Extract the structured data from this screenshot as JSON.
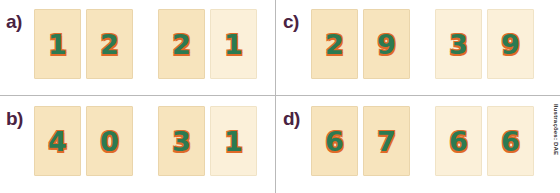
{
  "page": {
    "credit": "Ilustrações: DAE",
    "colors": {
      "card_fill": "#f7e4bd",
      "card_fill_pale": "#fbf0d9",
      "card_border": "#ead5ab",
      "digit_green": "#2c7a52",
      "digit_shadow_orange": "#e06a28",
      "label_purple": "#4a2342",
      "divider_gray": "#b9b9b9",
      "background": "#ffffff"
    }
  },
  "items": [
    {
      "id": "a",
      "label": "a)",
      "left_group": {
        "cards": [
          {
            "digit": "1",
            "pale": false
          },
          {
            "digit": "2",
            "pale": false
          }
        ]
      },
      "right_group": {
        "cards": [
          {
            "digit": "2",
            "pale": false
          },
          {
            "digit": "1",
            "pale": true
          }
        ]
      }
    },
    {
      "id": "c",
      "label": "c)",
      "left_group": {
        "cards": [
          {
            "digit": "2",
            "pale": false
          },
          {
            "digit": "9",
            "pale": false
          }
        ]
      },
      "right_group": {
        "cards": [
          {
            "digit": "3",
            "pale": true
          },
          {
            "digit": "9",
            "pale": true
          }
        ]
      }
    },
    {
      "id": "b",
      "label": "b)",
      "left_group": {
        "cards": [
          {
            "digit": "4",
            "pale": false
          },
          {
            "digit": "0",
            "pale": false
          }
        ]
      },
      "right_group": {
        "cards": [
          {
            "digit": "3",
            "pale": false
          },
          {
            "digit": "1",
            "pale": true
          }
        ]
      }
    },
    {
      "id": "d",
      "label": "d)",
      "left_group": {
        "cards": [
          {
            "digit": "6",
            "pale": false
          },
          {
            "digit": "7",
            "pale": false
          }
        ]
      },
      "right_group": {
        "cards": [
          {
            "digit": "6",
            "pale": true
          },
          {
            "digit": "6",
            "pale": true
          }
        ]
      }
    }
  ]
}
